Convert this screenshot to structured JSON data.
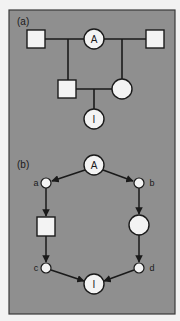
{
  "figure": {
    "background_color": "#f2f2f2",
    "panel_color": "#8f8f8f",
    "panel_border_color": "#3a3a3a",
    "node_fill": "#f3f3f3",
    "line_color": "#1a1a1a"
  },
  "panel_a": {
    "label": "(a)",
    "nodes": {
      "ancestor": {
        "label": "A",
        "shape": "circle"
      },
      "top_left": {
        "label": "",
        "shape": "square"
      },
      "top_right": {
        "label": "",
        "shape": "square"
      },
      "father": {
        "label": "",
        "shape": "square"
      },
      "mother": {
        "label": "",
        "shape": "circle"
      },
      "individual": {
        "label": "I",
        "shape": "circle"
      }
    }
  },
  "panel_b": {
    "label": "(b)",
    "nodes": {
      "ancestor": {
        "label": "A",
        "shape": "circle"
      },
      "a": {
        "label": "a",
        "shape": "small-circle"
      },
      "b": {
        "label": "b",
        "shape": "small-circle"
      },
      "left_middle": {
        "label": "",
        "shape": "square"
      },
      "right_middle": {
        "label": "",
        "shape": "circle"
      },
      "c": {
        "label": "c",
        "shape": "small-circle"
      },
      "d": {
        "label": "d",
        "shape": "small-circle"
      },
      "individual": {
        "label": "I",
        "shape": "circle"
      }
    }
  }
}
